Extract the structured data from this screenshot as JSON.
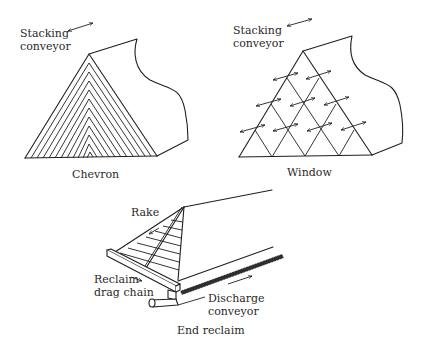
{
  "figure": {
    "type": "stockpile-stacking-methods-diagram",
    "panels": [
      {
        "id": "chevron",
        "caption": "Chevron",
        "labels": {
          "conveyor_line1": "Stacking",
          "conveyor_line2": "conveyor"
        },
        "layer_count": 11
      },
      {
        "id": "window",
        "caption": "Window",
        "labels": {
          "conveyor_line1": "Stacking",
          "conveyor_line2": "conveyor"
        },
        "rows": 4,
        "arrow_count": 11
      },
      {
        "id": "end-reclaim",
        "caption": "End reclaim",
        "labels": {
          "rake": "Rake",
          "drag_chain_line1": "Reclaim",
          "drag_chain_line2": "drag chain",
          "discharge_line1": "Discharge",
          "discharge_line2": "conveyor"
        }
      }
    ],
    "colors": {
      "line": "#1f1f1f",
      "text": "#2a2a2a",
      "background": "#ffffff"
    }
  }
}
